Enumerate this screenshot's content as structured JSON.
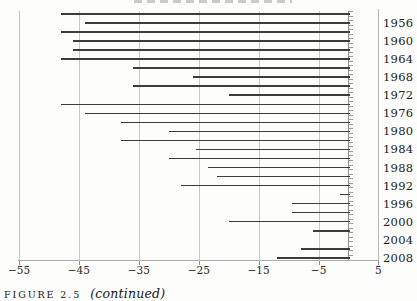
{
  "figure": {
    "caption_label": "FIGURE 2.5",
    "caption_note": "(continued)"
  },
  "chart_data": {
    "type": "bar",
    "orientation": "horizontal",
    "title": "",
    "xlabel": "",
    "ylabel": "",
    "xlim": [
      -55,
      5
    ],
    "grid": "on",
    "gridline_values": [
      -45,
      -35,
      -25,
      -15,
      -5
    ],
    "zero_axis_value": 0,
    "categories": [
      "1956",
      "1960",
      "1964",
      "1968",
      "1972",
      "1976",
      "1980",
      "1984",
      "1988",
      "1992",
      "1996",
      "2000",
      "2004",
      "2008"
    ],
    "series": [
      {
        "name": "upper-bar",
        "values": [
          -48,
          -48,
          -46,
          -36,
          -36,
          -48,
          -38,
          -38,
          -30,
          -22,
          -1.5,
          -9.5,
          -6,
          -8
        ]
      },
      {
        "name": "lower-bar",
        "values": [
          -44,
          -46,
          -48,
          -26,
          -20,
          -44,
          -30,
          -25.5,
          -23.5,
          -28,
          -9.5,
          -20,
          0,
          -12
        ]
      }
    ],
    "x_tick_values": [
      -55,
      -45,
      -35,
      -25,
      -15,
      -5,
      5
    ],
    "x_tick_labels": [
      "−55",
      "−45",
      "−35",
      "−25",
      "−15",
      "−5",
      "5"
    ],
    "legend": "none",
    "bar_color": "#3c3c3a"
  }
}
